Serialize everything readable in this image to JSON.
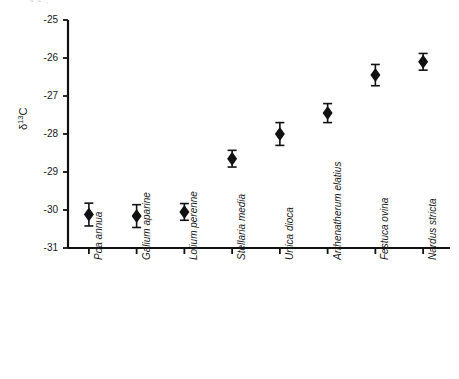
{
  "figure": {
    "top_artifact_text": "ᵈ ᵉ      ˒",
    "background_color": "#ffffff",
    "marker_color": "#111111",
    "axis_color": "#111111"
  },
  "chart_data": {
    "type": "scatter",
    "title": "",
    "xlabel": "",
    "ylabel": "δ13C",
    "ylabel_display": "δ13C",
    "ylim": [
      -31,
      -25
    ],
    "yticks": [
      -25,
      -26,
      -27,
      -28,
      -29,
      -30,
      -31
    ],
    "ytick_labels": [
      "-25",
      "-26",
      "-27",
      "-28",
      "-29",
      "-30",
      "-31"
    ],
    "grid": false,
    "legend": null,
    "error_bar_style": "capped",
    "marker_style": "diamond",
    "categories": [
      "Poa annua",
      "Galium aparine",
      "Lolium perenne",
      "Stellaria media",
      "Urtica dioca",
      "Arrhenatherum elatius",
      "Festuca ovina",
      "Nardus stricta"
    ],
    "values": [
      -30.12,
      -30.16,
      -30.05,
      -28.65,
      -28.0,
      -27.45,
      -26.45,
      -26.1
    ],
    "errors": [
      0.3,
      0.3,
      0.22,
      0.22,
      0.3,
      0.25,
      0.28,
      0.22
    ],
    "points": [
      {
        "label": "Poa annua",
        "value": -30.12,
        "error": 0.3
      },
      {
        "label": "Galium aparine",
        "value": -30.16,
        "error": 0.3
      },
      {
        "label": "Lolium perenne",
        "value": -30.05,
        "error": 0.22
      },
      {
        "label": "Stellaria media",
        "value": -28.65,
        "error": 0.22
      },
      {
        "label": "Urtica dioca",
        "value": -28.0,
        "error": 0.3
      },
      {
        "label": "Arrhenatherum elatius",
        "value": -27.45,
        "error": 0.25
      },
      {
        "label": "Festuca ovina",
        "value": -26.45,
        "error": 0.28
      },
      {
        "label": "Nardus stricta",
        "value": -26.1,
        "error": 0.22
      }
    ]
  }
}
